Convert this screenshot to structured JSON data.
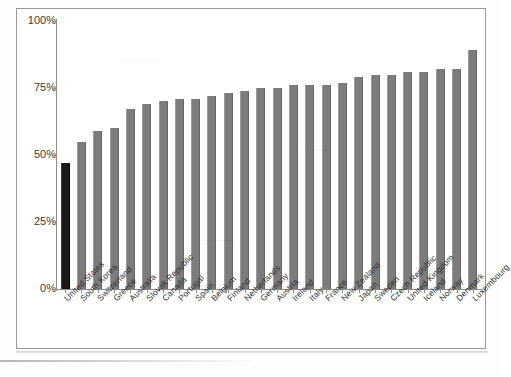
{
  "chart_data": {
    "type": "bar",
    "title": "",
    "xlabel": "",
    "ylabel": "",
    "ylim": [
      0,
      100
    ],
    "ytick_labels": [
      "100%",
      "75%",
      "50%",
      "25%",
      "0%"
    ],
    "ytick_values": [
      100,
      75,
      50,
      25,
      0
    ],
    "grid": false,
    "legend": "none",
    "value_suffix": "%",
    "highlight_category": "United States",
    "colors": {
      "bar": "#7c7c7c",
      "highlight_bar": "#1a1a1a",
      "axis": "#8d8d8d",
      "frame": "#9a9a9a",
      "text": "#333333",
      "background": "#ffffff"
    },
    "categories": [
      "United States",
      "South Korea",
      "Switzerland",
      "Greece",
      "Australia",
      "Slovak Republic",
      "Canada",
      "Portugal",
      "Spain",
      "Belgium",
      "Finland",
      "Netherlands",
      "Germany",
      "Austria",
      "Ireland",
      "Italy",
      "France",
      "New Zealand",
      "Japan",
      "Sweden",
      "Czech Republic",
      "United Kingdom",
      "Iceland",
      "Norway",
      "Denmark",
      "Luxembourg"
    ],
    "values": [
      47,
      55,
      59,
      60,
      67,
      69,
      70,
      71,
      71,
      72,
      73,
      74,
      75,
      75,
      76,
      76,
      76,
      77,
      79,
      80,
      80,
      81,
      81,
      82,
      82,
      89
    ]
  }
}
